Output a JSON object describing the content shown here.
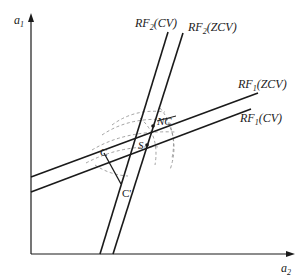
{
  "diagram": {
    "axes": {
      "y_label": "a",
      "y_sub": "1",
      "x_label": "a",
      "x_sub": "2"
    },
    "curves": [
      {
        "id": "rf2-cv",
        "name": "RF",
        "sub": "2",
        "suffix": "(CV)"
      },
      {
        "id": "rf2-zcv",
        "name": "RF",
        "sub": "2",
        "suffix": "(ZCV)"
      },
      {
        "id": "rf1-zcv",
        "name": "RF",
        "sub": "1",
        "suffix": "(ZCV)"
      },
      {
        "id": "rf1-cv",
        "name": "RF",
        "sub": "1",
        "suffix": "(CV)"
      }
    ],
    "points": {
      "nc": "NC",
      "s": "S",
      "c": "C",
      "c_prime": "C'"
    },
    "colors": {
      "line": "#1a1a1a",
      "dashed": "#888888"
    }
  }
}
